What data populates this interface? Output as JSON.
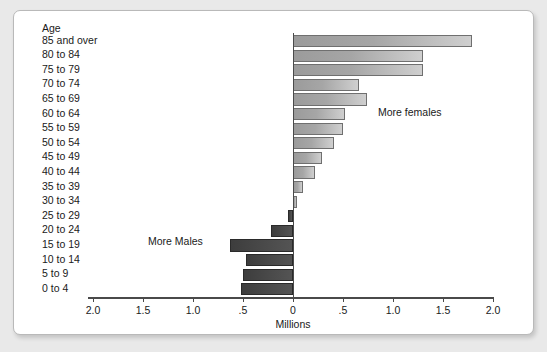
{
  "chart_data": {
    "type": "bar",
    "subtype": "population-pyramid",
    "title": "",
    "xlabel": "Millions",
    "ylabel": "Age",
    "categories": [
      "85 and over",
      "80 to 84",
      "75 to 79",
      "70 to 74",
      "65 to 69",
      "60 to 64",
      "55 to 59",
      "50 to 54",
      "45 to 49",
      "40 to 44",
      "35 to 39",
      "30 to 34",
      "25 to 29",
      "20 to 24",
      "15 to 19",
      "10 to 14",
      "5 to 9",
      "0 to 4"
    ],
    "series": [
      {
        "name": "More females",
        "side": "right",
        "color": "#a6a6a6",
        "values": [
          1.79,
          1.3,
          1.3,
          0.66,
          0.74,
          0.52,
          0.5,
          0.41,
          0.29,
          0.22,
          0.1,
          0.04,
          0.0,
          0.0,
          0.0,
          0.0,
          0.0,
          0.0
        ]
      },
      {
        "name": "More Males",
        "side": "left",
        "color": "#4a4a4a",
        "values": [
          0.0,
          0.0,
          0.0,
          0.0,
          0.0,
          0.0,
          0.0,
          0.0,
          0.0,
          0.0,
          0.0,
          0.0,
          0.05,
          0.22,
          0.63,
          0.47,
          0.5,
          0.52
        ]
      }
    ],
    "xlim": [
      -2.0,
      2.0
    ],
    "xticks": [
      2.0,
      1.5,
      1.0,
      0.5,
      0,
      0.5,
      1.0,
      1.5,
      2.0
    ],
    "xtick_labels": [
      "2.0",
      "1.5",
      "1.0",
      ".5",
      "0",
      ".5",
      "1.0",
      "1.5",
      "2.0"
    ],
    "grid": false,
    "legend": "none",
    "annotations": [
      {
        "text": "More females",
        "x": 0.85,
        "category": "60 to 64"
      },
      {
        "text": "More Males",
        "x": -1.45,
        "category": "20 to 24"
      }
    ]
  },
  "axis": {
    "y_header": "Age",
    "x_title": "Millions"
  },
  "colors": {
    "female_bar": "#a6a6a6",
    "male_bar": "#4a4a4a",
    "axis": "#4a4a4a",
    "panel_background": "#ffffff",
    "page_background": "#e9e9e9"
  }
}
